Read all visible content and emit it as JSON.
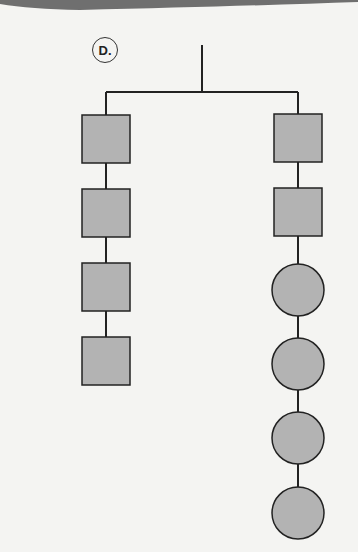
{
  "label": "D.",
  "colors": {
    "background": "#f4f4f2",
    "band": "#6f6f6f",
    "line": "#222222",
    "shape_fill": "#b3b3b3"
  },
  "mobile": {
    "description": "Hanging mobile with two arms",
    "left_arm": {
      "shapes": [
        "square",
        "square",
        "square",
        "square"
      ]
    },
    "right_arm": {
      "shapes": [
        "square",
        "square",
        "circle",
        "circle",
        "circle",
        "circle"
      ]
    }
  }
}
